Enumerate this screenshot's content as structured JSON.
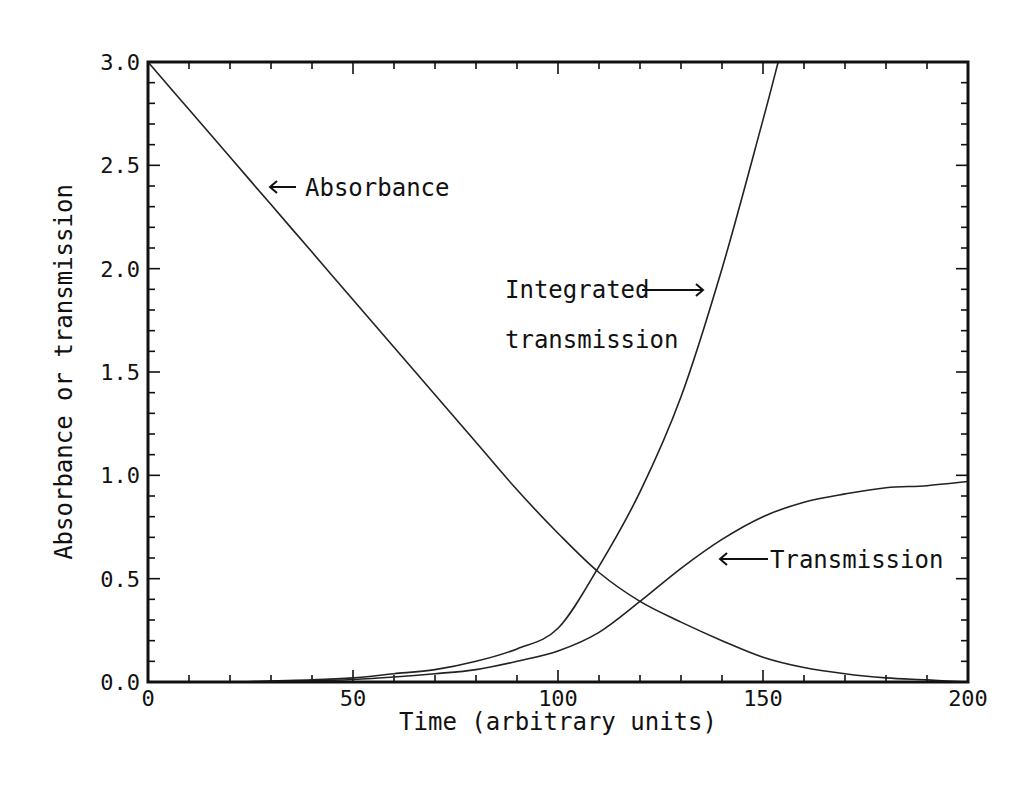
{
  "chart_data": {
    "type": "line",
    "title": "",
    "xlabel": "Time (arbitrary units)",
    "ylabel": "Absorbance or transmission",
    "xlim": [
      0,
      200
    ],
    "ylim": [
      0.0,
      3.0
    ],
    "xticks": [
      "0",
      "50",
      "100",
      "150",
      "200"
    ],
    "yticks": [
      "0.0",
      "0.5",
      "1.0",
      "1.5",
      "2.0",
      "2.5",
      "3.0"
    ],
    "x_minor_step": 10,
    "y_minor_step": 0.1,
    "grid": false,
    "legend": "inline annotations with arrows",
    "series": [
      {
        "name": "Absorbance",
        "x": [
          0,
          10,
          20,
          30,
          40,
          50,
          60,
          70,
          80,
          90,
          100,
          110,
          120,
          130,
          140,
          150,
          160,
          170,
          180,
          190,
          200
        ],
        "values": [
          3.0,
          2.77,
          2.54,
          2.31,
          2.08,
          1.85,
          1.62,
          1.39,
          1.16,
          0.93,
          0.72,
          0.53,
          0.39,
          0.29,
          0.2,
          0.12,
          0.07,
          0.04,
          0.02,
          0.01,
          0.0
        ]
      },
      {
        "name": "Transmission",
        "x": [
          0,
          10,
          20,
          30,
          40,
          50,
          60,
          70,
          80,
          90,
          100,
          110,
          120,
          130,
          140,
          150,
          160,
          170,
          180,
          190,
          200
        ],
        "values": [
          0.0,
          0.0,
          0.0,
          0.003,
          0.006,
          0.012,
          0.024,
          0.04,
          0.06,
          0.1,
          0.15,
          0.24,
          0.39,
          0.55,
          0.69,
          0.8,
          0.87,
          0.91,
          0.94,
          0.95,
          0.97
        ]
      },
      {
        "name": "Integrated transmission",
        "x": [
          0,
          10,
          20,
          30,
          40,
          50,
          60,
          70,
          80,
          90,
          100,
          110,
          120,
          130,
          140,
          150,
          153.7
        ],
        "values": [
          0.0,
          0.0,
          0.0,
          0.005,
          0.01,
          0.02,
          0.04,
          0.06,
          0.1,
          0.16,
          0.26,
          0.56,
          0.92,
          1.38,
          2.0,
          2.72,
          3.0
        ]
      }
    ],
    "annotations": [
      {
        "text": "Absorbance",
        "arrow": "left",
        "x": 40,
        "y": 2.36
      },
      {
        "text": "Integrated",
        "line2": "transmission",
        "arrow": "right",
        "x": 88,
        "y": 1.89
      },
      {
        "text": "Transmission",
        "arrow": "left",
        "x": 140,
        "y": 0.56
      }
    ]
  },
  "page": {
    "number": ""
  }
}
